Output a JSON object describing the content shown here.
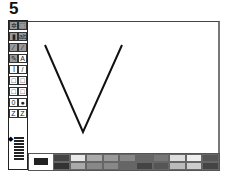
{
  "figure_label": "5",
  "toolbox": {
    "tools": [
      {
        "name": "free-select",
        "glyph": "✲"
      },
      {
        "name": "rect-select",
        "glyph": "⬚"
      },
      {
        "name": "eraser",
        "glyph": "▮"
      },
      {
        "name": "fill",
        "glyph": "abc"
      },
      {
        "name": "pick-color",
        "glyph": "⁄"
      },
      {
        "name": "magnifier",
        "glyph": "⁄"
      },
      {
        "name": "pencil",
        "glyph": "✎"
      },
      {
        "name": "text",
        "glyph": "A"
      },
      {
        "name": "curve",
        "glyph": "ꟾ"
      },
      {
        "name": "line",
        "glyph": "/"
      },
      {
        "name": "rectangle",
        "glyph": "□"
      },
      {
        "name": "filled-rectangle",
        "glyph": "□"
      },
      {
        "name": "rounded-rectangle",
        "glyph": "□"
      },
      {
        "name": "filled-rounded-rectangle",
        "glyph": "□"
      },
      {
        "name": "ellipse",
        "glyph": "0"
      },
      {
        "name": "filled-ellipse",
        "glyph": "●"
      },
      {
        "name": "polygon",
        "glyph": "Z"
      },
      {
        "name": "filled-polygon",
        "glyph": "Z"
      }
    ],
    "line_width_indicator": "◆"
  },
  "palette": {
    "current_color": "#222222",
    "swatches_top": [
      "#444444",
      "#e8e8e8",
      "#aaaaaa",
      "#999999",
      "#888888",
      "#666666",
      "#777777",
      "#dddddd",
      "#eeeeee",
      "#555555"
    ],
    "swatches_bottom": [
      "#333333",
      "#aaaaaa",
      "#888888",
      "#888888",
      "#666666",
      "#444444",
      "#555555",
      "#bbbbbb",
      "#cccccc",
      "#444444"
    ]
  },
  "drawing": {
    "shape": "V",
    "stroke": "#111111"
  }
}
